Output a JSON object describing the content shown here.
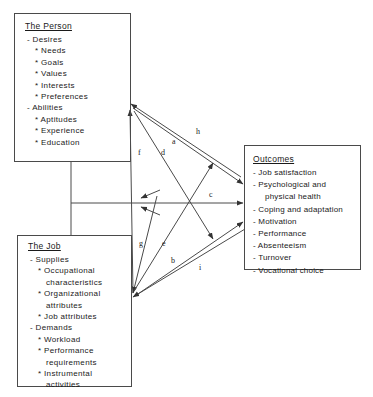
{
  "diagram": {
    "nodes": {
      "person": {
        "title": "The Person",
        "groups": [
          {
            "label": "- Desires",
            "items": [
              "* Needs",
              "* Goals",
              "* Values",
              "* Interests",
              "* Preferences"
            ]
          },
          {
            "label": "- Abilities",
            "items": [
              "* Aptitudes",
              "* Experience",
              "* Education"
            ]
          }
        ]
      },
      "job": {
        "title": "The Job",
        "groups": [
          {
            "label": "- Supplies",
            "items": [
              "* Occupational",
              "characteristics",
              "* Organizational",
              "attributes",
              "* Job   attributes"
            ]
          },
          {
            "label": "- Demands",
            "items": [
              "* Workload",
              "* Performance",
              "requirements",
              "* Instrumental",
              "activities"
            ]
          }
        ]
      },
      "outcomes": {
        "title": "Outcomes",
        "items": [
          "- Job    satisfaction",
          "- Psychological and",
          "physical health",
          "- Coping and adaptation",
          "- Motivation",
          "- Performance",
          "- Absenteeism",
          "- Turnover",
          "- Vocational   choice"
        ]
      }
    },
    "edges": [
      {
        "id": "a",
        "label": "a",
        "from": "outcomes",
        "to": "person"
      },
      {
        "id": "b",
        "label": "b",
        "from": "job",
        "to": "outcomes"
      },
      {
        "id": "c",
        "label": "c",
        "from": "person-job-link",
        "to": "outcomes"
      },
      {
        "id": "d",
        "label": "d",
        "from": "person",
        "to": "outcomes"
      },
      {
        "id": "e",
        "label": "e",
        "from": "job",
        "to": "outcomes"
      },
      {
        "id": "f",
        "label": "f",
        "from": "job",
        "to": "person"
      },
      {
        "id": "g",
        "label": "g",
        "from": "outcomes",
        "to": "job"
      },
      {
        "id": "h",
        "label": "h",
        "from": "person",
        "to": "outcomes"
      },
      {
        "id": "i",
        "label": "i",
        "from": "outcomes",
        "to": "job"
      }
    ],
    "colors": {
      "stroke": "#4a4a4a",
      "text": "#1a1a1a",
      "background": "#ffffff"
    }
  }
}
